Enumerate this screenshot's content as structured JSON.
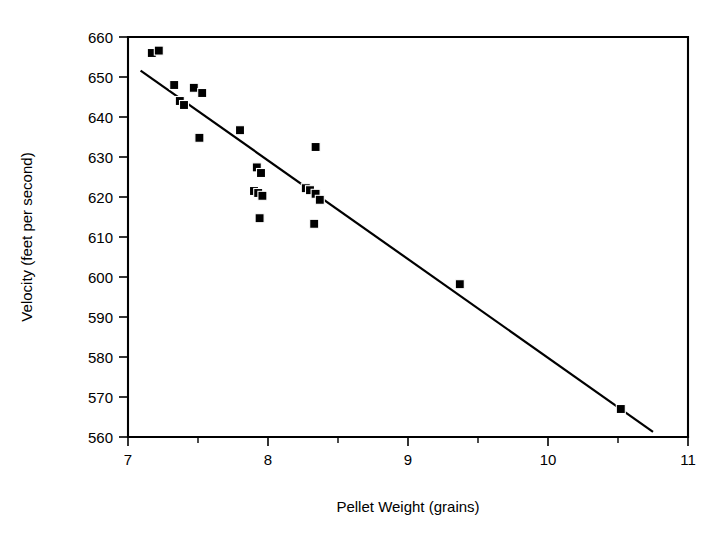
{
  "chart_data": {
    "type": "scatter",
    "title": "",
    "xlabel": "Pellet Weight (grains)",
    "ylabel": "Velocity (feet per second)",
    "xlim": [
      7,
      11
    ],
    "ylim": [
      560,
      660
    ],
    "grid": false,
    "legend": null,
    "x_ticks": [
      7,
      8,
      9,
      10,
      11
    ],
    "x_tick_labels": [
      "7",
      "8",
      "9",
      "10",
      "11"
    ],
    "x_minor_ticks": [
      7.5,
      8.5,
      9.5,
      10.5
    ],
    "y_ticks": [
      560,
      570,
      580,
      590,
      600,
      610,
      620,
      630,
      640,
      650,
      660
    ],
    "y_tick_labels": [
      "560",
      "570",
      "580",
      "590",
      "600",
      "610",
      "620",
      "630",
      "640",
      "650",
      "660"
    ],
    "points": [
      {
        "x": 7.17,
        "y": 656.0
      },
      {
        "x": 7.22,
        "y": 656.6
      },
      {
        "x": 7.33,
        "y": 648.0
      },
      {
        "x": 7.37,
        "y": 644.0
      },
      {
        "x": 7.4,
        "y": 643.0
      },
      {
        "x": 7.47,
        "y": 647.3
      },
      {
        "x": 7.53,
        "y": 646.0
      },
      {
        "x": 7.51,
        "y": 634.8
      },
      {
        "x": 7.8,
        "y": 636.7
      },
      {
        "x": 7.92,
        "y": 627.4
      },
      {
        "x": 7.95,
        "y": 626.0
      },
      {
        "x": 7.9,
        "y": 621.5
      },
      {
        "x": 7.93,
        "y": 621.0
      },
      {
        "x": 7.96,
        "y": 620.3
      },
      {
        "x": 7.94,
        "y": 614.7
      },
      {
        "x": 8.27,
        "y": 622.2
      },
      {
        "x": 8.3,
        "y": 621.7
      },
      {
        "x": 8.34,
        "y": 620.8
      },
      {
        "x": 8.37,
        "y": 619.3
      },
      {
        "x": 8.34,
        "y": 632.5
      },
      {
        "x": 8.33,
        "y": 613.3
      },
      {
        "x": 9.37,
        "y": 598.2
      },
      {
        "x": 10.52,
        "y": 567.0
      }
    ],
    "fit_line": {
      "type": "linear",
      "x_start": 7.09,
      "y_start": 651.6,
      "x_end": 10.75,
      "y_end": 561.3
    },
    "marker": {
      "shape": "square",
      "color": "#000000",
      "size_px": 9
    }
  },
  "axes": {
    "x_title": "Pellet Weight (grains)",
    "y_title": "Velocity (feet per second)"
  }
}
